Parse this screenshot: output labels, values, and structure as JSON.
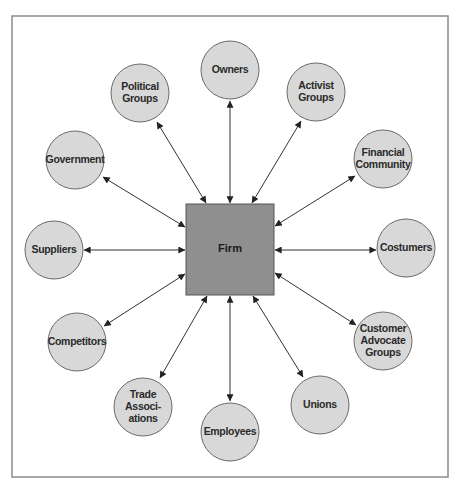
{
  "colors": {
    "background": "#ffffff",
    "frame": "#8a8a8a",
    "node_fill": "#d8d8d8",
    "node_stroke": "#6a6a6a",
    "firm_fill": "#8f8f8f",
    "firm_stroke": "#555555",
    "arrow": "#333333"
  },
  "frame": {
    "x": 12,
    "y": 16,
    "w": 436,
    "h": 461
  },
  "center": {
    "label": "Firm",
    "x": 186,
    "y": 204,
    "w": 88,
    "h": 91
  },
  "nodes": [
    {
      "id": "owners",
      "lines": [
        "Owners"
      ],
      "cx": 230,
      "cy": 70,
      "r": 29
    },
    {
      "id": "political-groups",
      "lines": [
        "Political",
        "Groups"
      ],
      "cx": 140,
      "cy": 93,
      "r": 29
    },
    {
      "id": "activist-groups",
      "lines": [
        "Activist",
        "Groups"
      ],
      "cx": 316,
      "cy": 92,
      "r": 29
    },
    {
      "id": "government",
      "lines": [
        "Government"
      ],
      "cx": 75,
      "cy": 160,
      "r": 29
    },
    {
      "id": "financial-community",
      "lines": [
        "Financial",
        "Community"
      ],
      "cx": 383,
      "cy": 159,
      "r": 29
    },
    {
      "id": "suppliers",
      "lines": [
        "Suppliers"
      ],
      "cx": 54,
      "cy": 250,
      "r": 29
    },
    {
      "id": "costumers",
      "lines": [
        "Costumers"
      ],
      "cx": 406,
      "cy": 248,
      "r": 29
    },
    {
      "id": "competitors",
      "lines": [
        "Competitors"
      ],
      "cx": 77,
      "cy": 342,
      "r": 29
    },
    {
      "id": "customer-advocate-groups",
      "lines": [
        "Customer",
        "Advocate",
        "Groups"
      ],
      "cx": 383,
      "cy": 341,
      "r": 29
    },
    {
      "id": "trade-associations",
      "lines": [
        "Trade",
        "Associ-",
        "ations"
      ],
      "cx": 143,
      "cy": 407,
      "r": 29
    },
    {
      "id": "unions",
      "lines": [
        "Unions"
      ],
      "cx": 320,
      "cy": 405,
      "r": 29
    },
    {
      "id": "employees",
      "lines": [
        "Employees"
      ],
      "cx": 230,
      "cy": 432,
      "r": 29
    }
  ],
  "edges": [
    {
      "to": "owners",
      "x1": 230,
      "y1": 101,
      "x2": 230,
      "y2": 203
    },
    {
      "to": "political-groups",
      "x1": 157,
      "y1": 122,
      "x2": 206,
      "y2": 203
    },
    {
      "to": "activist-groups",
      "x1": 301,
      "y1": 121,
      "x2": 252,
      "y2": 203
    },
    {
      "to": "government",
      "x1": 103,
      "y1": 177,
      "x2": 185,
      "y2": 227
    },
    {
      "to": "financial-community",
      "x1": 355,
      "y1": 176,
      "x2": 275,
      "y2": 226
    },
    {
      "to": "suppliers",
      "x1": 84,
      "y1": 250,
      "x2": 185,
      "y2": 250
    },
    {
      "to": "costumers",
      "x1": 376,
      "y1": 250,
      "x2": 275,
      "y2": 250
    },
    {
      "to": "competitors",
      "x1": 104,
      "y1": 326,
      "x2": 185,
      "y2": 274
    },
    {
      "to": "customer-advocate-groups",
      "x1": 356,
      "y1": 325,
      "x2": 275,
      "y2": 273
    },
    {
      "to": "trade-associations",
      "x1": 160,
      "y1": 378,
      "x2": 207,
      "y2": 296
    },
    {
      "to": "unions",
      "x1": 303,
      "y1": 377,
      "x2": 253,
      "y2": 296
    },
    {
      "to": "employees",
      "x1": 230,
      "y1": 401,
      "x2": 230,
      "y2": 296
    }
  ]
}
